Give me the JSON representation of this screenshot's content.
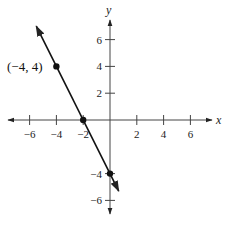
{
  "chart_data": {
    "type": "line",
    "title": "",
    "xlabel": "x",
    "ylabel": "y",
    "xlim": [
      -8,
      8
    ],
    "ylim": [
      -8,
      8
    ],
    "grid": false,
    "x_ticks": [
      -6,
      -4,
      -2,
      2,
      4,
      6
    ],
    "y_ticks": [
      -6,
      -4,
      2,
      4,
      6
    ],
    "x_tick_labels": [
      "−6",
      "−4",
      "−2",
      "2",
      "4",
      "6"
    ],
    "y_tick_labels": [
      "−6",
      "−4",
      "2",
      "4",
      "6"
    ],
    "series": [
      {
        "name": "line",
        "equation": "y = -2x - 4",
        "slope": -2,
        "intercept": -4,
        "x": [
          -5.5,
          0.65
        ],
        "y": [
          7,
          -5.3
        ]
      }
    ],
    "points": [
      {
        "x": -4,
        "y": 4,
        "label": "(−4, 4)"
      },
      {
        "x": -2,
        "y": 0,
        "label": ""
      },
      {
        "x": 0,
        "y": -4,
        "label": ""
      }
    ],
    "annotations": [
      "(−4, 4)"
    ]
  }
}
